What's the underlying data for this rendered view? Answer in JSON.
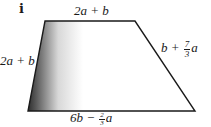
{
  "part_label": "i",
  "shape": {
    "type": "trapezium",
    "vertices": [
      [
        45,
        21
      ],
      [
        135,
        21
      ],
      [
        195,
        111
      ],
      [
        28,
        111
      ]
    ],
    "stroke": "#1a1a1a",
    "shading": {
      "from": "#3a3a3a",
      "to": "#ffffff",
      "region": "left portion"
    }
  },
  "labels": {
    "top": {
      "main": "2a + b"
    },
    "left": {
      "main": "2a + b"
    },
    "right": {
      "prefix": "b + ",
      "num": "7",
      "den": "3",
      "suffix": "a"
    },
    "bottom": {
      "prefix": "6b − ",
      "num": "2",
      "den": "3",
      "suffix": "a"
    }
  }
}
